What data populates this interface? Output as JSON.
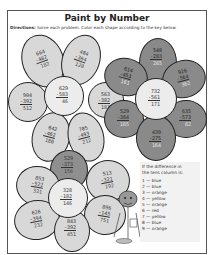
{
  "worksheet": {
    "title": "Paint by Number",
    "directions_label": "Directions:",
    "directions_text": "Solve each problem. Color each shape according to the key below."
  },
  "flowers": [
    {
      "name": "top-left-flower",
      "shade": "light",
      "problems": [
        {
          "top": "664",
          "sub": "-482",
          "ans": "182"
        },
        {
          "top": "484",
          "sub": "-364",
          "ans": "120"
        },
        {
          "top": "904",
          "sub": "-392",
          "ans": "512"
        },
        {
          "top": "629",
          "sub": "-583",
          "ans": "46"
        },
        {
          "top": "563",
          "sub": "-382",
          "ans": "181"
        },
        {
          "top": "642",
          "sub": "-462",
          "ans": "180"
        },
        {
          "top": "705",
          "sub": "-493",
          "ans": "212"
        }
      ]
    },
    {
      "name": "right-flower",
      "shade": "dark",
      "problems": [
        {
          "top": "548",
          "sub": "-283",
          "ans": "265"
        },
        {
          "top": "614",
          "sub": "-453",
          "ans": "161"
        },
        {
          "top": "926",
          "sub": "-564",
          "ans": "362"
        },
        {
          "top": "732",
          "sub": "-561",
          "ans": "171"
        },
        {
          "top": "529",
          "sub": "-364",
          "ans": "165"
        },
        {
          "top": "635",
          "sub": "-573",
          "ans": "62"
        },
        {
          "top": "439",
          "sub": "-275",
          "ans": "164"
        }
      ]
    },
    {
      "name": "bottom-flower",
      "shade": "light",
      "problems": [
        {
          "top": "529",
          "sub": "-373",
          "ans": "156"
        },
        {
          "top": "853",
          "sub": "-522",
          "ans": "331"
        },
        {
          "top": "513",
          "sub": "-321",
          "ans": "192"
        },
        {
          "top": "328",
          "sub": "-182",
          "ans": "146"
        },
        {
          "top": "626",
          "sub": "-394",
          "ans": "232"
        },
        {
          "top": "896",
          "sub": "-145",
          "ans": "751"
        },
        {
          "top": "843",
          "sub": "-392",
          "ans": "451"
        }
      ]
    }
  ],
  "key": {
    "heading_line1": "If the difference in",
    "heading_line2": "the tens column is:",
    "items": [
      {
        "digit": "1",
        "color": "blue"
      },
      {
        "digit": "2",
        "color": "blue"
      },
      {
        "digit": "3",
        "color": "orange"
      },
      {
        "digit": "4",
        "color": "yellow"
      },
      {
        "digit": "5",
        "color": "orange"
      },
      {
        "digit": "6",
        "color": "red"
      },
      {
        "digit": "7",
        "color": "yellow"
      },
      {
        "digit": "8",
        "color": "blue"
      },
      {
        "digit": "9",
        "color": "orange"
      }
    ]
  }
}
